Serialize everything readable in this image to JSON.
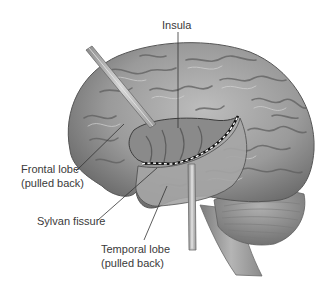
{
  "figure": {
    "labels": {
      "insula": "Insula",
      "frontal_lobe_line1": "Frontal lobe",
      "frontal_lobe_line2": "(pulled back)",
      "sylvan_fissure": "Sylvan fissure",
      "temporal_lobe_line1": "Temporal lobe",
      "temporal_lobe_line2": "(pulled back)"
    },
    "colors": {
      "background": "#ffffff",
      "brain_base": "#9a9a9a",
      "brain_light": "#c8c8c8",
      "brain_dark": "#555555",
      "retractor": "#a8a8a8",
      "label_text": "#3a3a3a",
      "leader_line": "#333333",
      "dashed_fissure": "#ffffff"
    }
  }
}
